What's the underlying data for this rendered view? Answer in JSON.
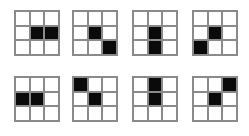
{
  "board": {
    "name": "nine-cell-pattern-series",
    "background_color": "#ffffff",
    "grid_line_color": "#8a8a8a",
    "filled_cell_color": "#0a0a0a",
    "empty_cell_color": "#ffffff",
    "rows": 3,
    "columns": 3,
    "figure_count": 8
  },
  "figures": [
    {
      "index": 1,
      "label": "figure-1",
      "position": {
        "left": 14,
        "top": 10,
        "width": 46,
        "height": 46
      },
      "cells": [
        [
          0,
          0,
          0
        ],
        [
          0,
          1,
          1
        ],
        [
          0,
          0,
          0
        ]
      ],
      "filled_coordinates": [
        [
          2,
          2
        ],
        [
          2,
          3
        ]
      ],
      "filled_count": 2
    },
    {
      "index": 2,
      "label": "figure-2",
      "position": {
        "left": 72,
        "top": 10,
        "width": 46,
        "height": 46
      },
      "cells": [
        [
          0,
          0,
          0
        ],
        [
          0,
          1,
          0
        ],
        [
          0,
          0,
          1
        ]
      ],
      "filled_coordinates": [
        [
          2,
          2
        ],
        [
          3,
          3
        ]
      ],
      "filled_count": 2
    },
    {
      "index": 3,
      "label": "figure-3",
      "position": {
        "left": 132,
        "top": 10,
        "width": 46,
        "height": 46
      },
      "cells": [
        [
          0,
          0,
          0
        ],
        [
          0,
          1,
          0
        ],
        [
          0,
          1,
          0
        ]
      ],
      "filled_coordinates": [
        [
          2,
          2
        ],
        [
          3,
          2
        ]
      ],
      "filled_count": 2
    },
    {
      "index": 4,
      "label": "figure-4",
      "position": {
        "left": 192,
        "top": 10,
        "width": 46,
        "height": 46
      },
      "cells": [
        [
          0,
          0,
          0
        ],
        [
          0,
          1,
          0
        ],
        [
          1,
          0,
          0
        ]
      ],
      "filled_coordinates": [
        [
          2,
          2
        ],
        [
          3,
          1
        ]
      ],
      "filled_count": 2
    },
    {
      "index": 5,
      "label": "figure-5",
      "position": {
        "left": 14,
        "top": 76,
        "width": 46,
        "height": 46
      },
      "cells": [
        [
          0,
          0,
          0
        ],
        [
          1,
          1,
          0
        ],
        [
          0,
          0,
          0
        ]
      ],
      "filled_coordinates": [
        [
          2,
          1
        ],
        [
          2,
          2
        ]
      ],
      "filled_count": 2
    },
    {
      "index": 6,
      "label": "figure-6",
      "position": {
        "left": 72,
        "top": 76,
        "width": 46,
        "height": 46
      },
      "cells": [
        [
          1,
          0,
          0
        ],
        [
          0,
          1,
          0
        ],
        [
          0,
          0,
          0
        ]
      ],
      "filled_coordinates": [
        [
          1,
          1
        ],
        [
          2,
          2
        ]
      ],
      "filled_count": 2
    },
    {
      "index": 7,
      "label": "figure-7",
      "position": {
        "left": 132,
        "top": 76,
        "width": 46,
        "height": 46
      },
      "cells": [
        [
          0,
          1,
          0
        ],
        [
          0,
          1,
          0
        ],
        [
          0,
          0,
          0
        ]
      ],
      "filled_coordinates": [
        [
          1,
          2
        ],
        [
          2,
          2
        ]
      ],
      "filled_count": 2
    },
    {
      "index": 8,
      "label": "figure-8",
      "position": {
        "left": 192,
        "top": 76,
        "width": 46,
        "height": 46
      },
      "cells": [
        [
          0,
          0,
          1
        ],
        [
          0,
          1,
          0
        ],
        [
          0,
          0,
          0
        ]
      ],
      "filled_coordinates": [
        [
          1,
          3
        ],
        [
          2,
          2
        ]
      ],
      "filled_count": 2
    }
  ]
}
